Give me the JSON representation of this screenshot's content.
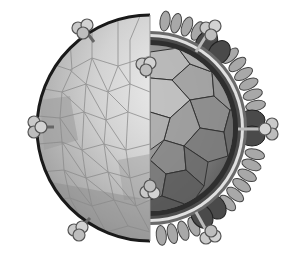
{
  "figure": {
    "style": "grayscale cutaway",
    "colors": {
      "background": "#ffffff",
      "outer_shell_light": "#e2e2e2",
      "outer_shell_mid": "#bdbdbd",
      "outer_shell_dark": "#8e8e8e",
      "tessellation_line": "#8a8a8a",
      "envelope_outline": "#1a1a1a",
      "capsid_light": "#b4b4b4",
      "capsid_mid": "#8c8c8c",
      "capsid_dark": "#5e5e5e",
      "capsid_line": "#333333",
      "membrane_band": "#d6d6d6",
      "lobes": "#9a9a9a",
      "lobe_outline": "#444444",
      "dark_glycoprotein": "#4d4d4d",
      "spike_head": "#c9c9c9",
      "spike_outline": "#555555"
    },
    "spikes": [
      {
        "x": 80,
        "y": 26,
        "angle": -60
      },
      {
        "x": 210,
        "y": 30,
        "angle": 55
      },
      {
        "x": 38,
        "y": 127,
        "angle": 180
      },
      {
        "x": 268,
        "y": 129,
        "angle": 0
      },
      {
        "x": 146,
        "y": 68,
        "angle": -90
      },
      {
        "x": 150,
        "y": 188,
        "angle": 90
      },
      {
        "x": 78,
        "y": 230,
        "angle": 230
      },
      {
        "x": 210,
        "y": 236,
        "angle": 120
      }
    ]
  }
}
